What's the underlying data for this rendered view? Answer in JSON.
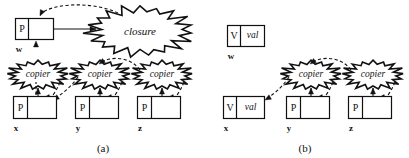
{
  "figure": {
    "background_color": "#ffffff",
    "ink_color": "#111111",
    "panels": [
      {
        "id": "panel-a",
        "caption": "(a)",
        "caption_pos": {
          "x": 103,
          "y": 143
        },
        "cells": [
          {
            "name": "w",
            "label": "w",
            "label_pos": {
              "x": 19,
              "y": 45
            },
            "box": {
              "x": 15,
              "y": 18,
              "w": 38,
              "h": 21
            },
            "divider_x": 28,
            "left_text": "P",
            "right_text": ""
          },
          {
            "name": "x",
            "label": "x",
            "label_pos": {
              "x": 16,
              "y": 124
            },
            "box": {
              "x": 13,
              "y": 96,
              "w": 43,
              "h": 22
            },
            "divider_x": 27,
            "left_text": "P",
            "right_text": ""
          },
          {
            "name": "y",
            "label": "y",
            "label_pos": {
              "x": 78,
              "y": 124
            },
            "box": {
              "x": 75,
              "y": 96,
              "w": 43,
              "h": 22
            },
            "divider_x": 89,
            "left_text": "P",
            "right_text": ""
          },
          {
            "name": "z",
            "label": "z",
            "label_pos": {
              "x": 140,
              "y": 124
            },
            "box": {
              "x": 137,
              "y": 96,
              "w": 43,
              "h": 22
            },
            "divider_x": 151,
            "left_text": "P",
            "right_text": ""
          }
        ],
        "blobs": [
          {
            "name": "closure",
            "text": "closure",
            "shape": "starburst",
            "cx": 140,
            "cy": 31,
            "rx": 45,
            "ry": 21,
            "points": 19,
            "spike": 0.2,
            "font_class": "closure-text"
          },
          {
            "name": "copier-x",
            "text": "copier",
            "shape": "starburst",
            "cx": 38,
            "cy": 75,
            "rx": 25,
            "ry": 12,
            "points": 17,
            "spike": 0.24,
            "font_class": "blob-text"
          },
          {
            "name": "copier-y",
            "text": "copier",
            "shape": "starburst",
            "cx": 100,
            "cy": 75,
            "rx": 25,
            "ry": 12,
            "points": 17,
            "spike": 0.24,
            "font_class": "blob-text"
          },
          {
            "name": "copier-z",
            "text": "copier",
            "shape": "starburst",
            "cx": 162,
            "cy": 75,
            "rx": 25,
            "ry": 12,
            "points": 17,
            "spike": 0.24,
            "font_class": "blob-text"
          }
        ],
        "solid_arrows": [
          {
            "name": "arrow-w-to-closure",
            "x1": 42,
            "y1": 29,
            "x2": 96,
            "y2": 29
          },
          {
            "name": "arrow-x-to-copier-x",
            "x1": 38,
            "y1": 114,
            "x2": 38,
            "y2": 88
          },
          {
            "name": "arrow-y-to-copier-y",
            "x1": 100,
            "y1": 114,
            "x2": 100,
            "y2": 88
          },
          {
            "name": "arrow-z-to-copier-z",
            "x1": 162,
            "y1": 114,
            "x2": 162,
            "y2": 88
          }
        ],
        "dashed_arrows": [
          {
            "name": "dash-closure-to-w",
            "path": "M 118 13 C 95 2 55 2 40 14",
            "tip": {
              "x": 40,
              "y": 16,
              "angle": 115
            }
          },
          {
            "name": "dash-copier-x-to-w",
            "path": "M 36 95 C 36 90 36 88 36 82",
            "tip": {
              "x": 36,
              "y": 41,
              "angle": -90
            }
          },
          {
            "name": "dash-copier-x-chain",
            "path": "M 60 82 C 56 92 52 96 50 100",
            "tip": {
              "x": 50,
              "y": 101,
              "angle": 60
            }
          },
          {
            "name": "dash-copier-y-to-x",
            "path": "M 78 77 C 70 88 62 94 54 99",
            "tip": {
              "x": 53,
              "y": 100,
              "angle": 148
            }
          },
          {
            "name": "dash-copier-y-chain",
            "path": "M 122 82 C 118 92 114 96 112 100",
            "tip": {
              "x": 112,
              "y": 101,
              "angle": 60
            }
          },
          {
            "name": "dash-copier-z-to-y",
            "path": "M 140 70 C 130 56 110 56 100 63",
            "tip": {
              "x": 99,
              "y": 64,
              "angle": 145
            }
          },
          {
            "name": "dash-copier-z-chain",
            "path": "M 184 82 C 180 92 176 96 174 100",
            "tip": {
              "x": 174,
              "y": 101,
              "angle": 60
            }
          }
        ]
      },
      {
        "id": "panel-b",
        "caption": "(b)",
        "caption_pos": {
          "x": 305,
          "y": 143
        },
        "cells": [
          {
            "name": "w",
            "label": "w",
            "label_pos": {
              "x": 231,
              "y": 52
            },
            "box": {
              "x": 227,
              "y": 25,
              "w": 37,
              "h": 21
            },
            "divider_x": 240,
            "left_text": "V",
            "right_text": "val"
          },
          {
            "name": "x",
            "label": "x",
            "label_pos": {
              "x": 226,
              "y": 124
            },
            "box": {
              "x": 223,
              "y": 96,
              "w": 41,
              "h": 22
            },
            "divider_x": 236,
            "left_text": "V",
            "right_text": "val"
          },
          {
            "name": "y",
            "label": "y",
            "label_pos": {
              "x": 289,
              "y": 124
            },
            "box": {
              "x": 286,
              "y": 96,
              "w": 43,
              "h": 22
            },
            "divider_x": 300,
            "left_text": "P",
            "right_text": ""
          },
          {
            "name": "z",
            "label": "z",
            "label_pos": {
              "x": 351,
              "y": 124
            },
            "box": {
              "x": 348,
              "y": 96,
              "w": 43,
              "h": 22
            },
            "divider_x": 362,
            "left_text": "P",
            "right_text": ""
          }
        ],
        "blobs": [
          {
            "name": "copier-y",
            "text": "copier",
            "shape": "starburst",
            "cx": 311,
            "cy": 75,
            "rx": 25,
            "ry": 12,
            "points": 17,
            "spike": 0.24,
            "font_class": "blob-text"
          },
          {
            "name": "copier-z",
            "text": "copier",
            "shape": "starburst",
            "cx": 373,
            "cy": 75,
            "rx": 25,
            "ry": 12,
            "points": 17,
            "spike": 0.24,
            "font_class": "blob-text"
          }
        ],
        "solid_arrows": [
          {
            "name": "arrow-y-to-copier-y",
            "x1": 311,
            "y1": 114,
            "x2": 311,
            "y2": 88
          },
          {
            "name": "arrow-z-to-copier-z",
            "x1": 373,
            "y1": 114,
            "x2": 373,
            "y2": 88
          }
        ],
        "dashed_arrows": [
          {
            "name": "dash-copier-y-to-x",
            "path": "M 289 77 C 280 90 272 95 266 99",
            "tip": {
              "x": 265,
              "y": 100,
              "angle": 150
            }
          },
          {
            "name": "dash-copier-y-chain",
            "path": "M 333 82 C 329 92 325 96 323 100",
            "tip": {
              "x": 323,
              "y": 101,
              "angle": 60
            }
          },
          {
            "name": "dash-copier-z-to-y",
            "path": "M 351 70 C 341 56 321 56 311 63",
            "tip": {
              "x": 310,
              "y": 64,
              "angle": 145
            }
          },
          {
            "name": "dash-copier-z-chain",
            "path": "M 395 82 C 391 92 387 96 385 100",
            "tip": {
              "x": 385,
              "y": 101,
              "angle": 60
            }
          }
        ]
      }
    ]
  }
}
